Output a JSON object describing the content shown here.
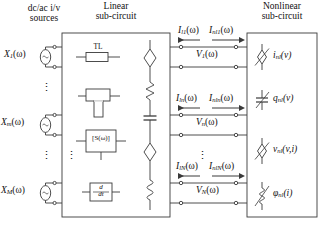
{
  "figure": {
    "type": "circuit-block-diagram",
    "background": "#ffffff",
    "line_color": "#3a3a3a",
    "text_color": "#111111"
  },
  "headers": {
    "sources_line1": "dc/ac i/v",
    "sources_line2": "sources",
    "linear_line1": "Linear",
    "linear_line2": "sub-circuit",
    "nonlinear_line1": "Nonlinear",
    "nonlinear_line2": "sub-circuit"
  },
  "sources": [
    {
      "name": "X",
      "sub": "1",
      "arg": "(ω)"
    },
    {
      "name": "X",
      "sub": "m",
      "arg": "(ω)"
    },
    {
      "name": "X",
      "sub": "M",
      "arg": "(ω)"
    }
  ],
  "linear_elements": [
    {
      "id": "transmission-line",
      "label": "TL"
    },
    {
      "id": "t-junction",
      "label": ""
    },
    {
      "id": "s-parameter-block",
      "label": "[S(ω)]"
    },
    {
      "id": "derivative-block",
      "label_num": "d",
      "label_den": "dt"
    }
  ],
  "linear_right_elements": [
    {
      "id": "dependent-source-1",
      "shape": "diamond"
    },
    {
      "id": "resistor-1",
      "shape": "zigzag"
    },
    {
      "id": "capacitor-1",
      "shape": "capacitor"
    },
    {
      "id": "dependent-source-2",
      "shape": "diamond"
    },
    {
      "id": "inductor-1",
      "shape": "coil"
    }
  ],
  "linear_currents": [
    {
      "name": "I",
      "sub": "l1",
      "arg": "(ω)"
    },
    {
      "name": "I",
      "sub": "ln",
      "arg": "(ω)"
    },
    {
      "name": "I",
      "sub": "lN",
      "arg": "(ω)"
    }
  ],
  "nonlinear_currents": [
    {
      "name": "I",
      "sub": "nl1",
      "arg": "(ω)"
    },
    {
      "name": "I",
      "sub": "nln",
      "arg": "(ω)"
    },
    {
      "name": "I",
      "sub": "nlN",
      "arg": "(ω)"
    }
  ],
  "port_voltages": [
    {
      "name": "V",
      "sub": "1",
      "arg": "(ω)"
    },
    {
      "name": "V",
      "sub": "n",
      "arg": "(ω)"
    },
    {
      "name": "V",
      "sub": "N",
      "arg": "(ω)"
    }
  ],
  "nonlinear_elements": [
    {
      "id": "nonlinear-current-source",
      "name": "i",
      "sub": "nl",
      "arg": "(v)"
    },
    {
      "id": "nonlinear-charge",
      "name": "q",
      "sub": "nl",
      "arg": "(v)"
    },
    {
      "id": "nonlinear-voltage-source",
      "name": "v",
      "sub": "nl",
      "arg": "(v,i)"
    },
    {
      "id": "nonlinear-flux",
      "name": "φ",
      "sub": "nl",
      "arg": "(i)"
    }
  ],
  "ellipses": {
    "glyph": "⋮"
  }
}
